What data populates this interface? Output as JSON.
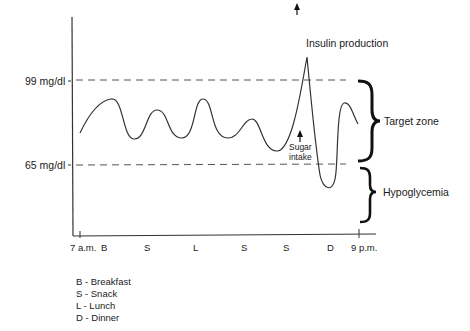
{
  "diagram": {
    "y_labels": {
      "upper": "99 mg/dl",
      "lower": "65 mg/dl"
    },
    "x_labels": {
      "start": "7 a.m.",
      "end": "9 p.m.",
      "meals": [
        "B",
        "S",
        "L",
        "S",
        "S",
        "D"
      ]
    },
    "annotations": {
      "insulin": "Insulin production",
      "sugar_line1": "Sugar",
      "sugar_line2": "intake"
    },
    "zones": {
      "target": "Target zone",
      "hypo": "Hypoglycemia"
    },
    "legend": [
      "B - Breakfast",
      "S - Snack",
      "L - Lunch",
      "D - Dinner"
    ],
    "colors": {
      "line": "#333333",
      "dash": "#555555",
      "brace": "#111111"
    }
  }
}
